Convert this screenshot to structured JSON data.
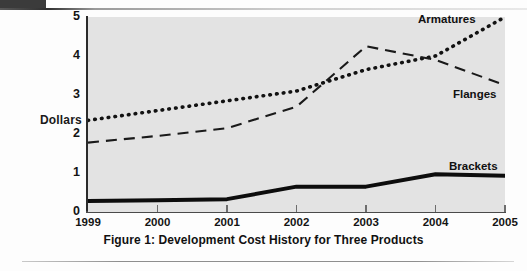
{
  "figure": {
    "caption": "Figure 1: Development Cost History for Three Products",
    "y_axis_title": "Dollars"
  },
  "chart_data": {
    "type": "line",
    "title": "Figure 1: Development Cost History for Three Products",
    "xlabel": "",
    "ylabel": "Dollars",
    "x": [
      1999,
      2000,
      2001,
      2002,
      2003,
      2004,
      2005
    ],
    "xlim": [
      1999,
      2005
    ],
    "ylim": [
      0,
      5
    ],
    "xtick_labels": [
      "1999",
      "2000",
      "2001",
      "2002",
      "2003",
      "2004",
      "2005"
    ],
    "ytick_labels": [
      "0",
      "1",
      "2",
      "3",
      "4",
      "5"
    ],
    "yticks": [
      0,
      1,
      2,
      3,
      4,
      5
    ],
    "grid": false,
    "legend_position": "inline-right-of-series",
    "series": [
      {
        "name": "Armatures",
        "style": "dotted",
        "color": "#121212",
        "values": [
          2.35,
          2.6,
          2.85,
          3.1,
          3.65,
          4.0,
          5.0
        ]
      },
      {
        "name": "Flanges",
        "style": "dashed",
        "color": "#1a1a1a",
        "values": [
          1.78,
          1.95,
          2.15,
          2.7,
          4.25,
          3.9,
          3.25
        ]
      },
      {
        "name": "Brackets",
        "style": "solid-thick",
        "color": "#0d0d0d",
        "values": [
          0.28,
          0.3,
          0.33,
          0.65,
          0.65,
          0.97,
          0.93
        ]
      }
    ],
    "annotations": [
      {
        "text": "Armatures",
        "near_series": "Armatures"
      },
      {
        "text": "Flanges",
        "near_series": "Flanges"
      },
      {
        "text": "Brackets",
        "near_series": "Brackets"
      }
    ]
  },
  "colors": {
    "plot_background": "#e3e3e3",
    "page_background": "#fdfdfd",
    "axis": "#2b2b2b",
    "ink": "#111111"
  }
}
